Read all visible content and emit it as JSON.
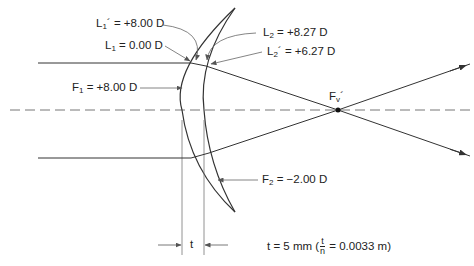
{
  "diagram": {
    "type": "thick-lens ray diagram",
    "labels": {
      "L1_prime": {
        "symbol": "L",
        "sub": "1",
        "prime": "´",
        "value": "= +8.00 D"
      },
      "L1": {
        "symbol": "L",
        "sub": "1",
        "value": "= 0.00 D"
      },
      "F1": {
        "symbol": "F",
        "sub": "1",
        "value": "= +8.00 D"
      },
      "L2": {
        "symbol": "L",
        "sub": "2",
        "value": "= +8.27 D"
      },
      "L2_prime": {
        "symbol": "L",
        "sub": "2",
        "prime": "´",
        "value": "= +6.27 D"
      },
      "F2": {
        "symbol": "F",
        "sub": "2",
        "value": "= −2.00 D"
      },
      "Fv_prime": {
        "symbol": "F",
        "sub": "v",
        "prime": "´"
      },
      "t_marker": "t",
      "thickness": {
        "prefix": "t = 5 mm (",
        "frac_num": "t",
        "frac_den": "n",
        "suffix": "= 0.0033 m)"
      }
    },
    "colors": {
      "line": "#333333",
      "axis_dash": "#777777",
      "text": "#222222"
    }
  }
}
